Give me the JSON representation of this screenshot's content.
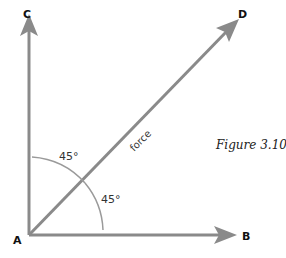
{
  "figure": {
    "caption": "Figure 3.10",
    "points": {
      "A": "A",
      "B": "B",
      "C": "C",
      "D": "D"
    },
    "vectors": [
      {
        "from": "A",
        "to": "C",
        "direction": "vertical"
      },
      {
        "from": "A",
        "to": "B",
        "direction": "horizontal"
      },
      {
        "from": "A",
        "to": "D",
        "direction": "diagonal",
        "label": "force"
      }
    ],
    "force_label": "force",
    "angles": {
      "upper": "45°",
      "lower": "45°"
    },
    "colors": {
      "arrow": "#8a8a8a",
      "arc": "#9a9a9a",
      "text": "#111111"
    }
  }
}
